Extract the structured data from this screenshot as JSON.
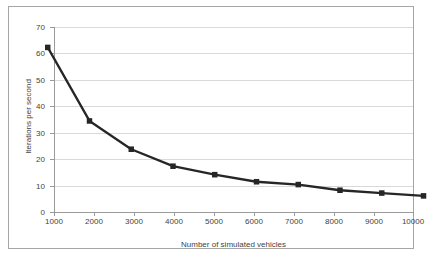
{
  "chart_data": {
    "type": "line",
    "title": "",
    "subtitle": "",
    "xlabel": "Number of simulated vehicles",
    "ylabel": "Iterations per second",
    "x": [
      1000,
      2000,
      3000,
      4000,
      5000,
      6000,
      7000,
      8000,
      9000,
      10000
    ],
    "values": [
      61,
      35,
      25,
      19,
      16,
      13.5,
      12.5,
      10.5,
      9.5,
      8.5
    ],
    "series": [
      {
        "name": "Iterations per second",
        "values": [
          61,
          35,
          25,
          19,
          16,
          13.5,
          12.5,
          10.5,
          9.5,
          8.5
        ]
      }
    ],
    "xtick_labels": [
      "1000",
      "2000",
      "3000",
      "4000",
      "5000",
      "6000",
      "7000",
      "8000",
      "9000",
      "10000"
    ],
    "ytick_labels": [
      "0",
      "10",
      "20",
      "30",
      "40",
      "50",
      "60",
      "70"
    ],
    "ytick_values": [
      0,
      10,
      20,
      30,
      40,
      50,
      60,
      70
    ],
    "xlim": [
      1000,
      10000
    ],
    "ylim": [
      0,
      70
    ],
    "grid": "horizontal",
    "legend": "none",
    "marker": "square",
    "line_color": "#262626",
    "marker_color": "#262626",
    "grid_color": "#d9d9d9",
    "axis_color": "#9a9a9a",
    "text_color": "#3f3f3f",
    "background_color": "#ffffff",
    "frame_color": "#a6a6a6"
  }
}
